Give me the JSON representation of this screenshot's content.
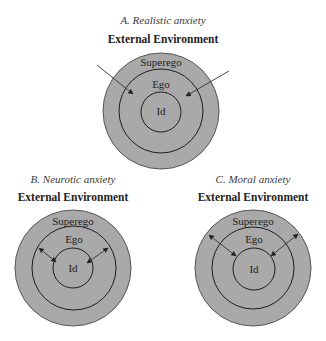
{
  "figure": {
    "panels": [
      {
        "id": "A",
        "title": "A. Realistic anxiety",
        "environment_label": "External Environment",
        "rings": {
          "outer": "Superego",
          "middle": "Ego",
          "inner": "Id"
        },
        "arrow_type": "single-headed, from external environment pointing inward to Ego",
        "center": [
          161,
          111
        ],
        "radii": [
          58,
          42,
          20
        ]
      },
      {
        "id": "B",
        "title": "B. Neurotic anxiety",
        "environment_label": "External Environment",
        "rings": {
          "outer": "Superego",
          "middle": "Ego",
          "inner": "Id"
        },
        "arrow_type": "double-headed, between Ego and Id",
        "center": [
          73,
          268
        ],
        "radii": [
          58,
          42,
          20
        ]
      },
      {
        "id": "C",
        "title": "C. Moral anxiety",
        "environment_label": "External Environment",
        "rings": {
          "outer": "Superego",
          "middle": "Ego",
          "inner": "Id"
        },
        "arrow_type": "double-headed, between Superego and Id",
        "center": [
          253,
          268
        ],
        "radii": [
          58,
          42,
          20
        ]
      }
    ],
    "colors": {
      "fill": "#a9a9a9",
      "stroke": "#1e1e1e",
      "text": "#1e1e1e",
      "title_text": "#3a3a3a"
    }
  }
}
